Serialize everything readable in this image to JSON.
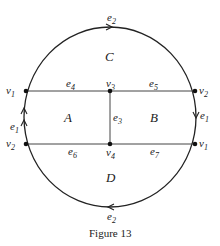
{
  "figure": {
    "caption": "Figure 13",
    "faces": {
      "A": "A",
      "B": "B",
      "C": "C",
      "D": "D"
    },
    "vertices": {
      "v1_left": {
        "name": "v",
        "sub": "1"
      },
      "v2_right": {
        "name": "v",
        "sub": "2"
      },
      "v3": {
        "name": "v",
        "sub": "3"
      },
      "v2_left": {
        "name": "v",
        "sub": "2"
      },
      "v1_right": {
        "name": "v",
        "sub": "1"
      },
      "v4": {
        "name": "v",
        "sub": "4"
      }
    },
    "edges": {
      "e2_top": {
        "name": "e",
        "sub": "2"
      },
      "e2_bottom": {
        "name": "e",
        "sub": "2"
      },
      "e1_left": {
        "name": "e",
        "sub": "1"
      },
      "e1_right": {
        "name": "e",
        "sub": "1"
      },
      "e3": {
        "name": "e",
        "sub": "3"
      },
      "e4": {
        "name": "e",
        "sub": "4"
      },
      "e5": {
        "name": "e",
        "sub": "5"
      },
      "e6": {
        "name": "e",
        "sub": "6"
      },
      "e7": {
        "name": "e",
        "sub": "7"
      }
    },
    "colors": {
      "stroke": "#222222",
      "background": "#ffffff"
    }
  }
}
